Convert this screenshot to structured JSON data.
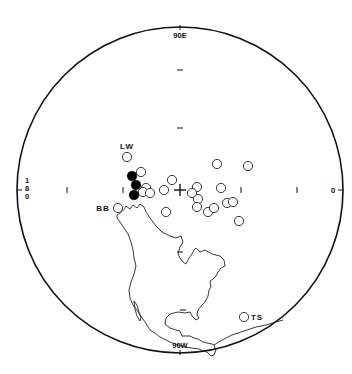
{
  "figure": {
    "type": "stereographic-projection",
    "labels": {
      "top": "90E",
      "bottom": "90W",
      "left": [
        "1",
        "8",
        "0"
      ],
      "right": "0"
    },
    "center_marker": "+",
    "colors": {
      "ink": "#111111",
      "background": "#ffffff"
    },
    "site_labels": [
      {
        "text": "LW",
        "x": 127,
        "y": 147
      },
      {
        "text": "BB",
        "x": 100,
        "y": 211
      },
      {
        "text": "TS",
        "x": 252,
        "y": 320
      }
    ],
    "filled_points": [
      {
        "x": 132,
        "y": 176
      },
      {
        "x": 136,
        "y": 185
      },
      {
        "x": 134,
        "y": 195
      }
    ],
    "open_points": [
      {
        "x": 127,
        "y": 157,
        "site": "LW"
      },
      {
        "x": 141,
        "y": 172
      },
      {
        "x": 146,
        "y": 188
      },
      {
        "x": 143,
        "y": 192
      },
      {
        "x": 150,
        "y": 193
      },
      {
        "x": 172,
        "y": 180
      },
      {
        "x": 164,
        "y": 190
      },
      {
        "x": 197,
        "y": 187
      },
      {
        "x": 192,
        "y": 193
      },
      {
        "x": 198,
        "y": 199
      },
      {
        "x": 197,
        "y": 207
      },
      {
        "x": 208,
        "y": 212
      },
      {
        "x": 214,
        "y": 208
      },
      {
        "x": 217,
        "y": 164
      },
      {
        "x": 248,
        "y": 166
      },
      {
        "x": 221,
        "y": 188
      },
      {
        "x": 227,
        "y": 203
      },
      {
        "x": 233,
        "y": 202
      },
      {
        "x": 239,
        "y": 221
      },
      {
        "x": 166,
        "y": 212
      },
      {
        "x": 118,
        "y": 208,
        "site": "BB"
      },
      {
        "x": 244,
        "y": 317,
        "site": "TS"
      }
    ]
  }
}
